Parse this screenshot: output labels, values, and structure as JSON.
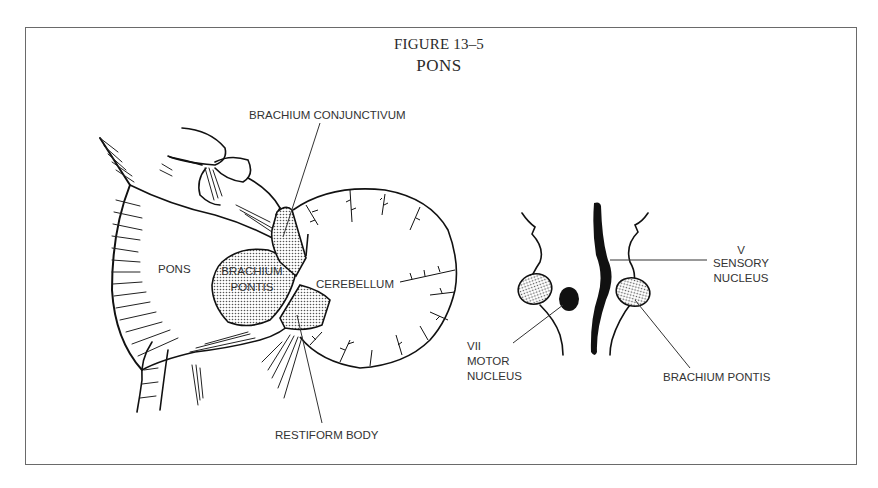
{
  "figure": {
    "number": "FIGURE 13–5",
    "title": "PONS"
  },
  "labels": {
    "brachium_conjunctivum": "BRACHIUM CONJUNCTIVUM",
    "pons": "PONS",
    "brachium_pontis_line1": "BRACHIUM",
    "brachium_pontis_line2": "PONTIS",
    "cerebellum": "CEREBELLUM",
    "restiform_body": "RESTIFORM BODY",
    "vii_line1": "VII",
    "vii_line2": "MOTOR",
    "vii_line3": "NUCLEUS",
    "v_line1": "V",
    "v_line2": "SENSORY",
    "v_line3": "NUCLEUS",
    "brachium_pontis_right": "BRACHIUM PONTIS"
  },
  "colors": {
    "ink": "#111111",
    "stipple": "#d9d9d9",
    "frame": "#6a6a6a"
  }
}
